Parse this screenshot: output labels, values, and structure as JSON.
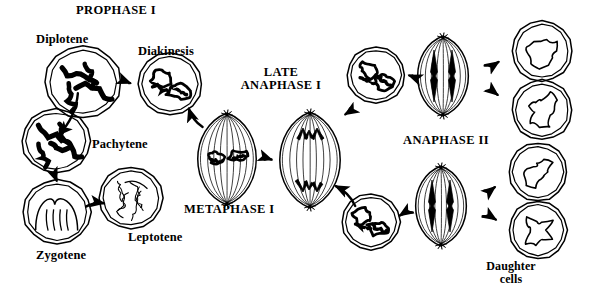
{
  "figure": {
    "title_text": "PROPHASE I",
    "background_color": "#ffffff",
    "ink_color": "#000000"
  },
  "labels": [
    {
      "id": "prophase-i",
      "text": "PROPHASE I",
      "x": 76,
      "y": 4,
      "kind": "phase",
      "align": "left"
    },
    {
      "id": "diplotene",
      "text": "Diplotene",
      "x": 36,
      "y": 33,
      "kind": "stage",
      "align": "left"
    },
    {
      "id": "diakinesis",
      "text": "Diakinesis",
      "x": 138,
      "y": 45,
      "kind": "stage",
      "align": "left"
    },
    {
      "id": "pachytene",
      "text": "Pachytene",
      "x": 92,
      "y": 138,
      "kind": "stage",
      "align": "left"
    },
    {
      "id": "zygotene",
      "text": "Zygotene",
      "x": 36,
      "y": 249,
      "kind": "stage",
      "align": "left"
    },
    {
      "id": "leptotene",
      "text": "Leptotene",
      "x": 128,
      "y": 231,
      "kind": "stage",
      "align": "left"
    },
    {
      "id": "metaphase-i",
      "text": "METAPHASE I",
      "x": 184,
      "y": 203,
      "kind": "phase",
      "align": "left"
    },
    {
      "id": "late-anaphase-i",
      "text": "LATE\nANAPHASE I",
      "x": 281,
      "y": 66,
      "kind": "phase",
      "align": "center"
    },
    {
      "id": "anaphase-ii",
      "text": "ANAPHASE II",
      "x": 403,
      "y": 134,
      "kind": "phase",
      "align": "left"
    },
    {
      "id": "daughter-cells",
      "text": "Daughter\ncells",
      "x": 511,
      "y": 260,
      "kind": "sub",
      "align": "center"
    }
  ],
  "cells": [
    {
      "id": "diplotene-cell",
      "name": "cell-diplotene",
      "cx": 83,
      "cy": 82,
      "rx": 38,
      "ry": 36,
      "type": "nucleus-thick-paired"
    },
    {
      "id": "diakinesis-cell",
      "name": "cell-diakinesis",
      "cx": 170,
      "cy": 84,
      "rx": 32,
      "ry": 31,
      "type": "nucleus-condensed"
    },
    {
      "id": "pachytene-cell",
      "name": "cell-pachytene",
      "cx": 56,
      "cy": 141,
      "rx": 34,
      "ry": 32,
      "type": "nucleus-thick-paired"
    },
    {
      "id": "zygotene-cell",
      "name": "cell-zygotene",
      "cx": 57,
      "cy": 212,
      "rx": 34,
      "ry": 32,
      "type": "nucleus-thin-paired"
    },
    {
      "id": "leptotene-cell",
      "name": "cell-leptotene",
      "cx": 131,
      "cy": 198,
      "rx": 32,
      "ry": 31,
      "type": "nucleus-threads"
    },
    {
      "id": "metaphase-i-cell",
      "name": "cell-metaphase-i",
      "cx": 227,
      "cy": 159,
      "rx": 30,
      "ry": 44,
      "type": "spindle-equator"
    },
    {
      "id": "early-anaphase-cell",
      "name": "cell-early-anaphase-i",
      "cx": 310,
      "cy": 160,
      "rx": 31,
      "ry": 46,
      "type": "spindle-poles"
    },
    {
      "id": "telophase-i-upper",
      "name": "cell-telophase-i-upper",
      "cx": 376,
      "cy": 75,
      "rx": 29,
      "ry": 28,
      "type": "nucleus-condensed"
    },
    {
      "id": "telophase-i-lower",
      "name": "cell-telophase-i-lower",
      "cx": 371,
      "cy": 222,
      "rx": 29,
      "ry": 28,
      "type": "nucleus-condensed"
    },
    {
      "id": "anaphase-ii-upper",
      "name": "cell-anaphase-ii-upper",
      "cx": 443,
      "cy": 76,
      "rx": 26,
      "ry": 38,
      "type": "spindle-split"
    },
    {
      "id": "anaphase-ii-lower",
      "name": "cell-anaphase-ii-lower",
      "cx": 441,
      "cy": 206,
      "rx": 26,
      "ry": 38,
      "type": "spindle-split"
    },
    {
      "id": "daughter-cell-1",
      "name": "cell-daughter-top-right",
      "cx": 542,
      "cy": 51,
      "rx": 30,
      "ry": 30,
      "type": "nucleus-relaxed"
    },
    {
      "id": "daughter-cell-2",
      "name": "cell-daughter-mid-right",
      "cx": 542,
      "cy": 110,
      "rx": 30,
      "ry": 30,
      "type": "nucleus-relaxed"
    },
    {
      "id": "daughter-cell-3",
      "name": "cell-daughter-upper-low",
      "cx": 538,
      "cy": 172,
      "rx": 29,
      "ry": 29,
      "type": "nucleus-relaxed"
    },
    {
      "id": "daughter-cell-4",
      "name": "cell-daughter-lower-low",
      "cx": 538,
      "cy": 230,
      "rx": 29,
      "ry": 29,
      "type": "nucleus-relaxed"
    }
  ],
  "arrows": [
    {
      "id": "arrow-leptotene-to-zygotene",
      "from": "leptotene-cell",
      "to": "zygotene-cell"
    },
    {
      "id": "arrow-zygotene-to-pachytene",
      "from": "zygotene-cell",
      "to": "pachytene-cell"
    },
    {
      "id": "arrow-pachytene-to-diplotene",
      "from": "pachytene-cell",
      "to": "diplotene-cell"
    },
    {
      "id": "arrow-diplotene-to-diakinesis",
      "from": "diplotene-cell",
      "to": "diakinesis-cell"
    },
    {
      "id": "arrow-diakinesis-to-metaphase",
      "from": "diakinesis-cell",
      "to": "metaphase-i-cell"
    },
    {
      "id": "arrow-metaphase-to-anaphase",
      "from": "metaphase-i-cell",
      "to": "early-anaphase-cell"
    },
    {
      "id": "arrow-anaphase-to-telo-upper",
      "from": "early-anaphase-cell",
      "to": "telophase-i-upper"
    },
    {
      "id": "arrow-anaphase-to-telo-lower",
      "from": "early-anaphase-cell",
      "to": "telophase-i-lower"
    },
    {
      "id": "arrow-telo-upper-to-ana2",
      "from": "telophase-i-upper",
      "to": "anaphase-ii-upper"
    },
    {
      "id": "arrow-telo-lower-to-ana2",
      "from": "telophase-i-lower",
      "to": "anaphase-ii-lower"
    },
    {
      "id": "arrow-ana2-upper-to-d1",
      "from": "anaphase-ii-upper",
      "to": "daughter-cell-1"
    },
    {
      "id": "arrow-ana2-upper-to-d2",
      "from": "anaphase-ii-upper",
      "to": "daughter-cell-2"
    },
    {
      "id": "arrow-ana2-lower-to-d3",
      "from": "anaphase-ii-lower",
      "to": "daughter-cell-3"
    },
    {
      "id": "arrow-ana2-lower-to-d4",
      "from": "anaphase-ii-lower",
      "to": "daughter-cell-4"
    }
  ]
}
